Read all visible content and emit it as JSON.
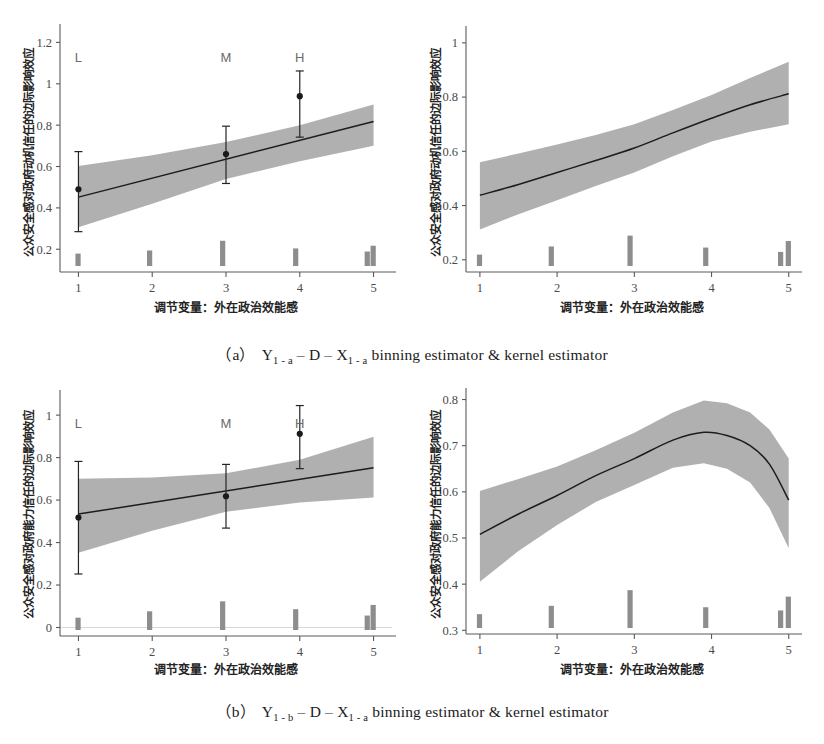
{
  "figure": {
    "axis_x_title": "调节变量：外在政治效能感",
    "captions": {
      "a": {
        "prefix": "（a）",
        "y": "Y",
        "y_sub": "1 - a",
        "dash": " – ",
        "d": "D",
        "x": "X",
        "x_sub": "1 - a",
        "tail": " binning estimator & kernel estimator"
      },
      "b": {
        "prefix": "（b）",
        "y": "Y",
        "y_sub": "1 - b",
        "dash": " – ",
        "d": "D",
        "x": "X",
        "x_sub": "1 - a",
        "tail": " binning estimator & kernel estimator"
      }
    },
    "colors": {
      "band": "#a9a9a9",
      "line": "#1c1c1c",
      "rug": "#8d8d8d",
      "axis": "#5a5a5a",
      "text": "#1a1a1a"
    }
  },
  "chart_data": [
    {
      "id": "panel-a-binning",
      "type": "line",
      "title": "",
      "xlabel": "调节变量：外在政治效能感",
      "ylabel": "公众安全感对政府动机信任的边际影响效应",
      "xlim": [
        0.75,
        5.25
      ],
      "ylim": [
        0.09,
        1.26
      ],
      "xticks": [
        1,
        2,
        3,
        4,
        5
      ],
      "xticklabels": [
        "1",
        "2",
        "3",
        "4",
        "5"
      ],
      "yticks": [
        0.2,
        0.4,
        0.6,
        0.8,
        1,
        1.2
      ],
      "yticklabels": [
        "0.2",
        "0.4",
        "0.6",
        "0.8",
        "1",
        "1.2"
      ],
      "grid": false,
      "legend": "none",
      "series": [
        {
          "name": "linear fit",
          "x": [
            1,
            5
          ],
          "values": [
            0.452,
            0.818
          ]
        },
        {
          "name": "ci_upper",
          "x": [
            1,
            2,
            3,
            4,
            5
          ],
          "values": [
            0.602,
            0.655,
            0.718,
            0.8,
            0.9
          ]
        },
        {
          "name": "ci_lower",
          "x": [
            1,
            2,
            3,
            4,
            5
          ],
          "values": [
            0.306,
            0.42,
            0.54,
            0.625,
            0.7
          ]
        }
      ],
      "binning_points": [
        {
          "label": "L",
          "x": 1,
          "estimate": 0.49,
          "ci_low": 0.285,
          "ci_high": 0.672
        },
        {
          "label": "M",
          "x": 3,
          "estimate": 0.66,
          "ci_low": 0.518,
          "ci_high": 0.795
        },
        {
          "label": "H",
          "x": 4,
          "estimate": 0.94,
          "ci_low": 0.742,
          "ci_high": 1.062
        }
      ],
      "rug": [
        {
          "x": 1.0,
          "height": 0.06
        },
        {
          "x": 1.97,
          "height": 0.075
        },
        {
          "x": 2.96,
          "height": 0.122
        },
        {
          "x": 3.95,
          "height": 0.085
        },
        {
          "x": 4.92,
          "height": 0.07
        },
        {
          "x": 5.0,
          "height": 0.098
        }
      ]
    },
    {
      "id": "panel-a-kernel",
      "type": "line",
      "title": "",
      "xlabel": "调节变量：外在政治效能感",
      "ylabel": "公众安全感对政府动机信任的边际影响效应",
      "xlim": [
        0.82,
        5.12
      ],
      "ylim": [
        0.155,
        1.04
      ],
      "xticks": [
        1,
        2,
        3,
        4,
        5
      ],
      "xticklabels": [
        "1",
        "2",
        "3",
        "4",
        "5"
      ],
      "yticks": [
        0.2,
        0.4,
        0.6,
        0.8,
        1
      ],
      "yticklabels": [
        "0.2",
        "0.4",
        "0.6",
        "0.8",
        "1"
      ],
      "grid": false,
      "legend": "none",
      "series": [
        {
          "name": "kernel estimate",
          "x": [
            1,
            1.5,
            2,
            2.5,
            3,
            3.5,
            4,
            4.5,
            5
          ],
          "values": [
            0.438,
            0.478,
            0.522,
            0.566,
            0.612,
            0.668,
            0.722,
            0.772,
            0.812
          ]
        },
        {
          "name": "ci_upper",
          "x": [
            1,
            1.5,
            2,
            2.5,
            3,
            3.5,
            4,
            4.5,
            5
          ],
          "values": [
            0.56,
            0.592,
            0.625,
            0.66,
            0.7,
            0.752,
            0.808,
            0.87,
            0.93
          ]
        },
        {
          "name": "ci_lower",
          "x": [
            1,
            1.5,
            2,
            2.5,
            3,
            3.5,
            4,
            4.5,
            5
          ],
          "values": [
            0.312,
            0.368,
            0.42,
            0.472,
            0.522,
            0.582,
            0.636,
            0.672,
            0.7
          ]
        }
      ],
      "binning_points": [],
      "rug": [
        {
          "x": 1.0,
          "height": 0.042
        },
        {
          "x": 1.93,
          "height": 0.072
        },
        {
          "x": 2.95,
          "height": 0.112
        },
        {
          "x": 3.93,
          "height": 0.068
        },
        {
          "x": 4.9,
          "height": 0.052
        },
        {
          "x": 5.0,
          "height": 0.092
        }
      ]
    },
    {
      "id": "panel-b-binning",
      "type": "line",
      "title": "",
      "xlabel": "调节变量：外在政治效能感",
      "ylabel": "公众安全感对政府能力信任的边际影响效应",
      "xlim": [
        0.75,
        5.25
      ],
      "ylim": [
        -0.04,
        1.09
      ],
      "xticks": [
        1,
        2,
        3,
        4,
        5
      ],
      "xticklabels": [
        "1",
        "2",
        "3",
        "4",
        "5"
      ],
      "yticks": [
        0,
        0.2,
        0.4,
        0.6,
        0.8,
        1
      ],
      "yticklabels": [
        "0",
        "0.2",
        "0.4",
        "0.6",
        "0.8",
        "1"
      ],
      "grid": false,
      "legend": "none",
      "zero_line": 0,
      "series": [
        {
          "name": "linear fit",
          "x": [
            1,
            5
          ],
          "values": [
            0.534,
            0.752
          ]
        },
        {
          "name": "ci_upper",
          "x": [
            1,
            2,
            3,
            4,
            5
          ],
          "values": [
            0.7,
            0.706,
            0.726,
            0.79,
            0.898
          ]
        },
        {
          "name": "ci_lower",
          "x": [
            1,
            2,
            3,
            4,
            5
          ],
          "values": [
            0.352,
            0.455,
            0.545,
            0.588,
            0.612
          ]
        }
      ],
      "binning_points": [
        {
          "label": "L",
          "x": 1,
          "estimate": 0.518,
          "ci_low": 0.252,
          "ci_high": 0.782
        },
        {
          "label": "M",
          "x": 3,
          "estimate": 0.618,
          "ci_low": 0.468,
          "ci_high": 0.768
        },
        {
          "label": "H",
          "x": 4,
          "estimate": 0.912,
          "ci_low": 0.748,
          "ci_high": 1.045
        }
      ],
      "rug": [
        {
          "x": 1.0,
          "height": 0.058
        },
        {
          "x": 1.97,
          "height": 0.088
        },
        {
          "x": 2.96,
          "height": 0.135
        },
        {
          "x": 3.95,
          "height": 0.098
        },
        {
          "x": 4.92,
          "height": 0.068
        },
        {
          "x": 5.0,
          "height": 0.118
        }
      ]
    },
    {
      "id": "panel-b-kernel",
      "type": "line",
      "title": "",
      "xlabel": "调节变量：外在政治效能感",
      "ylabel": "公众安全感对政府能力信任的边际影响效应",
      "xlim": [
        0.82,
        5.12
      ],
      "ylim": [
        0.292,
        0.812
      ],
      "xticks": [
        1,
        2,
        3,
        4,
        5
      ],
      "xticklabels": [
        "1",
        "2",
        "3",
        "4",
        "5"
      ],
      "yticks": [
        0.3,
        0.4,
        0.5,
        0.6,
        0.7,
        0.8
      ],
      "yticklabels": [
        "0.3",
        "0.4",
        "0.5",
        "0.6",
        "0.7",
        "0.8"
      ],
      "grid": false,
      "legend": "none",
      "series": [
        {
          "name": "kernel estimate",
          "x": [
            1,
            1.5,
            2,
            2.5,
            3,
            3.5,
            3.9,
            4.2,
            4.5,
            4.75,
            5
          ],
          "values": [
            0.508,
            0.552,
            0.592,
            0.635,
            0.672,
            0.712,
            0.729,
            0.722,
            0.7,
            0.66,
            0.582
          ]
        },
        {
          "name": "ci_upper",
          "x": [
            1,
            1.5,
            2,
            2.5,
            3,
            3.5,
            3.9,
            4.2,
            4.5,
            4.75,
            5
          ],
          "values": [
            0.602,
            0.628,
            0.655,
            0.69,
            0.728,
            0.772,
            0.798,
            0.792,
            0.772,
            0.735,
            0.672
          ]
        },
        {
          "name": "ci_lower",
          "x": [
            1,
            1.5,
            2,
            2.5,
            3,
            3.5,
            3.9,
            4.2,
            4.5,
            4.75,
            5
          ],
          "values": [
            0.405,
            0.472,
            0.528,
            0.578,
            0.615,
            0.652,
            0.662,
            0.65,
            0.62,
            0.565,
            0.478
          ]
        }
      ],
      "binning_points": [],
      "rug": [
        {
          "x": 1.0,
          "height": 0.03
        },
        {
          "x": 1.93,
          "height": 0.048
        },
        {
          "x": 2.95,
          "height": 0.082
        },
        {
          "x": 3.93,
          "height": 0.045
        },
        {
          "x": 4.9,
          "height": 0.038
        },
        {
          "x": 5.0,
          "height": 0.068
        }
      ]
    }
  ]
}
